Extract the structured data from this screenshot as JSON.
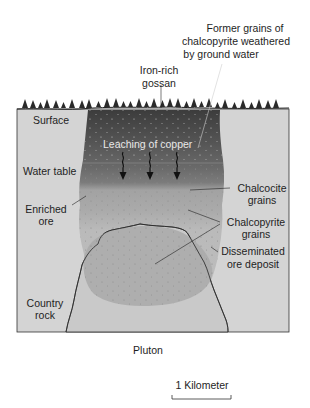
{
  "diagram": {
    "type": "cross-section",
    "labels": {
      "former_grains_line1": "Former grains of",
      "former_grains_line2": "chalcopyrite weathered",
      "former_grains_line3": "by ground water",
      "gossan_line1": "Iron-rich",
      "gossan_line2": "gossan",
      "surface": "Surface",
      "leaching": "Leaching of copper",
      "water_table": "Water table",
      "enriched_line1": "Enriched",
      "enriched_line2": "ore",
      "chalcocite_line1": "Chalcocite",
      "chalcocite_line2": "grains",
      "chalcopyrite_line1": "Chalcopyrite",
      "chalcopyrite_line2": "grains",
      "disseminated_line1": "Disseminated",
      "disseminated_line2": "ore deposit",
      "country_line1": "Country",
      "country_line2": "rock",
      "pluton": "Pluton"
    },
    "scale_bar": {
      "label": "1 Kilometer"
    },
    "colors": {
      "country_rock": "#d4d4d4",
      "gossan_dark": "#4a4a4a",
      "leached_zone": "#6e6e6e",
      "enriched_zone": "#a9a9a9",
      "disseminated": "#bdbdbd",
      "pluton": "#c9c9c9",
      "ore_body": "#a6a6a6",
      "trees": "#2a2a2a"
    }
  }
}
